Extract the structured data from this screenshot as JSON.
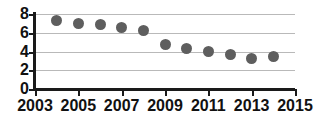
{
  "chart_data": {
    "type": "scatter",
    "title": "",
    "subtitle": "",
    "xlabel": "",
    "ylabel": "",
    "xlim": [
      2003,
      2015
    ],
    "ylim": [
      0,
      8
    ],
    "grid": true,
    "legend": null,
    "marker_color": "#5e5e5e",
    "axis_color": "#1a1a1a",
    "gridline_color": "#b9b9b9",
    "x_ticks": [
      "2003",
      "2005",
      "2007",
      "2009",
      "2011",
      "2013",
      "2015"
    ],
    "x_tick_values": [
      2003,
      2005,
      2007,
      2009,
      2011,
      2013,
      2015
    ],
    "y_ticks": [
      "0",
      "2",
      "4",
      "6",
      "8"
    ],
    "y_tick_values": [
      0,
      2,
      4,
      6,
      8
    ],
    "gridline_values": [
      2,
      4,
      6,
      8
    ],
    "x": [
      2004,
      2005,
      2006,
      2007,
      2008,
      2009,
      2010,
      2011,
      2012,
      2013,
      2014
    ],
    "values": [
      7.3,
      7.0,
      6.85,
      6.6,
      6.25,
      4.7,
      4.3,
      4.0,
      3.65,
      3.3,
      3.5
    ],
    "points": [
      {
        "x": 2004,
        "y": 7.3
      },
      {
        "x": 2005,
        "y": 7.0
      },
      {
        "x": 2006,
        "y": 6.85
      },
      {
        "x": 2007,
        "y": 6.6
      },
      {
        "x": 2008,
        "y": 6.25
      },
      {
        "x": 2009,
        "y": 4.7
      },
      {
        "x": 2010,
        "y": 4.3
      },
      {
        "x": 2011,
        "y": 4.0
      },
      {
        "x": 2012,
        "y": 3.65
      },
      {
        "x": 2013,
        "y": 3.3
      },
      {
        "x": 2014,
        "y": 3.5
      }
    ]
  }
}
